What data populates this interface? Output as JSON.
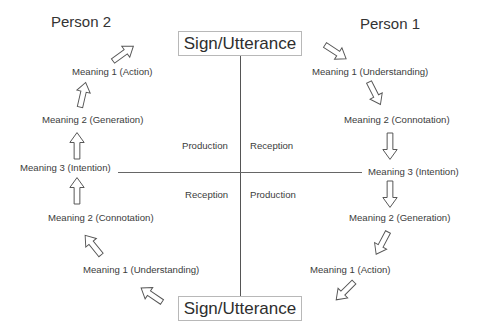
{
  "diagram": {
    "persons": {
      "left": "Person 2",
      "right": "Person 1"
    },
    "sign_top": "Sign/Utterance",
    "sign_bottom": "Sign/Utterance",
    "quadrants": {
      "top_left": "Production",
      "top_right": "Reception",
      "bottom_left": "Reception",
      "bottom_right": "Production"
    },
    "person1_chain": [
      "Meaning 1 (Understanding)",
      "Meaning 2  (Connotation)",
      "Meaning 3 (Intention)",
      "Meaning 2 (Generation)",
      "Meaning 1 (Action)"
    ],
    "person2_chain": [
      "Meaning 1 (Understanding)",
      "Meaning 2  (Connotation)",
      "Meaning 3 (Intention)",
      "Meaning 2 (Generation)",
      "Meaning 1 (Action)"
    ],
    "colors": {
      "line": "#555555",
      "arrow_stroke": "#555555",
      "box_border": "#b8b8b8",
      "text": "#3c3c3c"
    }
  }
}
